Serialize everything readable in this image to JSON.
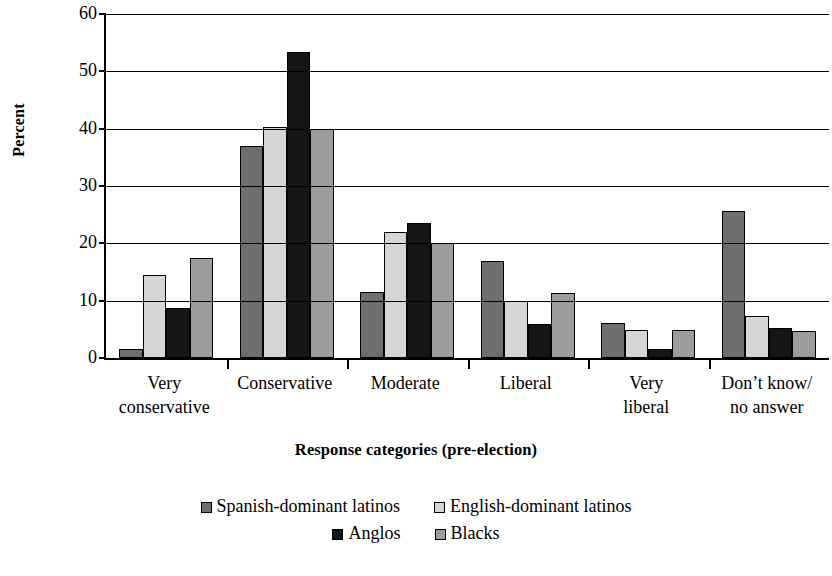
{
  "chart_data": {
    "type": "bar",
    "title": "",
    "xlabel": "Response categories (pre-election)",
    "ylabel": "Percent",
    "ylim": [
      0,
      60
    ],
    "ytick_values": [
      0,
      10,
      20,
      30,
      40,
      50,
      60
    ],
    "ytick_labels": [
      "0",
      "10",
      "20",
      "30",
      "40",
      "50",
      "60"
    ],
    "grid": true,
    "legend_position": "bottom",
    "categories": [
      "Very\nconservative",
      "Conservative",
      "Moderate",
      "Liberal",
      "Very\nliberal",
      "Don’t know/\nno answer"
    ],
    "series": [
      {
        "name": "Spanish-dominant latinos",
        "color": "#6e6e6e",
        "values": [
          1.5,
          37.0,
          11.5,
          17.0,
          6.1,
          25.6
        ]
      },
      {
        "name": "English-dominant latinos",
        "color": "#d6d6d6",
        "values": [
          14.4,
          40.3,
          22.0,
          10.0,
          4.8,
          7.3
        ]
      },
      {
        "name": "Anglos",
        "color": "#151515",
        "values": [
          8.8,
          53.4,
          23.5,
          6.0,
          1.5,
          5.2
        ]
      },
      {
        "name": "Blacks",
        "color": "#9c9c9c",
        "values": [
          17.5,
          39.9,
          20.0,
          11.4,
          4.8,
          4.7
        ]
      }
    ]
  },
  "legend": {
    "row1": [
      "Spanish-dominant latinos",
      "English-dominant latinos"
    ],
    "row2": [
      "Anglos",
      "Blacks"
    ]
  }
}
